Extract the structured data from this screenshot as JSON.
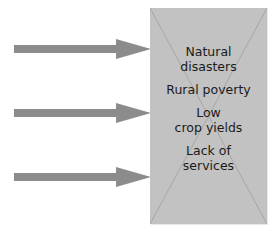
{
  "diagram": {
    "arrows": [
      {
        "id": "arrow-1",
        "y": 49
      },
      {
        "id": "arrow-2",
        "y": 113
      },
      {
        "id": "arrow-3",
        "y": 177
      }
    ],
    "box_labels": [
      {
        "line1": "Natural",
        "line2": "disasters"
      },
      {
        "line1": "Rural poverty",
        "line2": ""
      },
      {
        "line1": "Low",
        "line2": "crop yields"
      },
      {
        "line1": "Lack of",
        "line2": "services"
      }
    ],
    "colors": {
      "arrow": "#8c8c8c",
      "box": "#c2c2c2",
      "cross": "#a6a6a6",
      "text": "#1a1a1a"
    }
  }
}
